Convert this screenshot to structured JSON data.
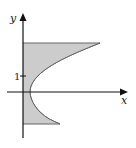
{
  "diagram": {
    "axes": {
      "x_label": "x",
      "y_label": "y",
      "tick_label": "1"
    },
    "region": {
      "fill": "#cccccc",
      "stroke": "#555555",
      "description": "Region bounded by the y-axis, horizontal lines y=3 and y=-2, and a parabola opening to the right"
    },
    "colors": {
      "axis": "#111111",
      "background": "#ffffff"
    }
  }
}
